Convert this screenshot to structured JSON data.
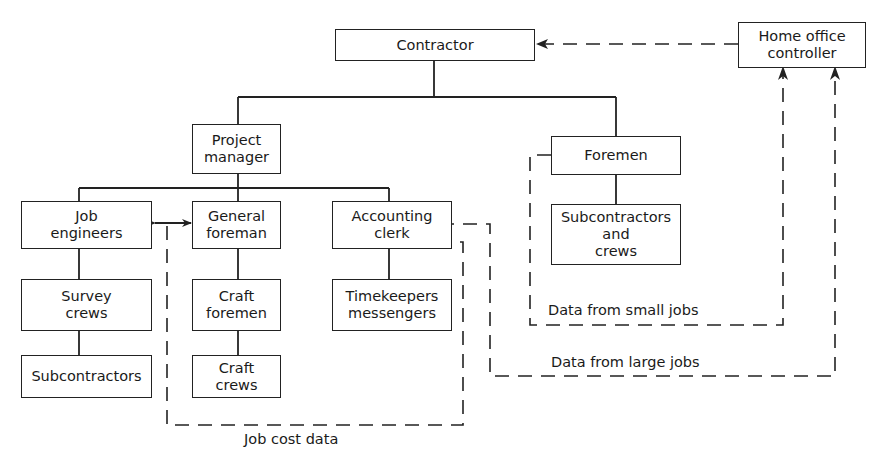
{
  "diagram": {
    "type": "organization-chart",
    "nodes": {
      "contractor": "Contractor",
      "home_office": "Home office\ncontroller",
      "project_manager": "Project\nmanager",
      "foremen": "Foremen",
      "subs_crews": "Subcontractors\nand\ncrews",
      "job_engineers": "Job\nengineers",
      "general_foreman": "General\nforeman",
      "accounting_clerk": "Accounting\nclerk",
      "survey_crews": "Survey\ncrews",
      "craft_foremen": "Craft\nforemen",
      "timekeepers": "Timekeepers\nmessengers",
      "subcontractors": "Subcontractors",
      "craft_crews": "Craft\ncrews"
    },
    "flow_labels": {
      "small_jobs": "Data from small jobs",
      "large_jobs": "Data from large jobs",
      "job_cost": "Job cost data"
    },
    "edges_solid": [
      [
        "Contractor",
        "Project manager"
      ],
      [
        "Contractor",
        "Foremen"
      ],
      [
        "Project manager",
        "Job engineers"
      ],
      [
        "Project manager",
        "General foreman"
      ],
      [
        "Project manager",
        "Accounting clerk"
      ],
      [
        "Foremen",
        "Subcontractors and crews"
      ],
      [
        "Job engineers",
        "Survey crews"
      ],
      [
        "Survey crews",
        "Subcontractors"
      ],
      [
        "General foreman",
        "Craft foremen"
      ],
      [
        "Craft foremen",
        "Craft crews"
      ],
      [
        "Accounting clerk",
        "Timekeepers messengers"
      ],
      [
        "Job engineers",
        "General foreman",
        "bidirectional"
      ]
    ],
    "edges_dashed": [
      [
        "Home office controller",
        "Contractor"
      ],
      [
        "Foremen",
        "Home office controller",
        "Data from small jobs"
      ],
      [
        "Accounting clerk",
        "Home office controller",
        "Data from large jobs"
      ],
      [
        "Accounting clerk",
        "Job engineers/General foreman link",
        "Job cost data"
      ]
    ],
    "colors": {
      "line": "#222222",
      "background": "#ffffff"
    }
  }
}
